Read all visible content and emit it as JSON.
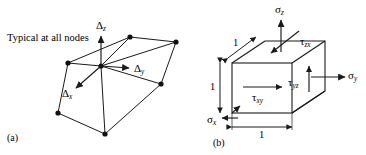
{
  "figure": {
    "panels": [
      {
        "id": "a",
        "caption": "(a)",
        "note": "Typical at all nodes",
        "labels": [
          {
            "name": "delta-z",
            "symbol": "Δ",
            "subscript": "z"
          },
          {
            "name": "delta-y",
            "symbol": "Δ",
            "subscript": "y"
          },
          {
            "name": "delta-x",
            "symbol": "Δ",
            "subscript": "x"
          }
        ],
        "nodes": [
          {
            "name": "node-center",
            "x": 101,
            "y": 66
          },
          {
            "name": "node-left-upper",
            "x": 68,
            "y": 63
          },
          {
            "name": "node-top-mid",
            "x": 130,
            "y": 37
          },
          {
            "name": "node-right-top",
            "x": 176,
            "y": 42
          },
          {
            "name": "node-right-mid",
            "x": 161,
            "y": 84
          },
          {
            "name": "node-bottom-mid",
            "x": 105,
            "y": 134
          },
          {
            "name": "node-left-lower",
            "x": 58,
            "y": 113
          }
        ],
        "edges": [
          [
            "node-left-upper",
            "node-top-mid"
          ],
          [
            "node-top-mid",
            "node-right-top"
          ],
          [
            "node-right-top",
            "node-right-mid"
          ],
          [
            "node-right-mid",
            "node-bottom-mid"
          ],
          [
            "node-bottom-mid",
            "node-left-lower"
          ],
          [
            "node-left-lower",
            "node-left-upper"
          ],
          [
            "node-left-upper",
            "node-center"
          ],
          [
            "node-center",
            "node-top-mid"
          ],
          [
            "node-center",
            "node-right-top"
          ],
          [
            "node-center",
            "node-bottom-mid"
          ],
          [
            "node-center",
            "node-right-mid"
          ]
        ],
        "vectors": [
          {
            "name": "delta-z-arrow",
            "from": [
              101,
              66
            ],
            "to": [
              101,
              34
            ]
          },
          {
            "name": "delta-y-arrow",
            "from": [
              101,
              66
            ],
            "to": [
              131,
              68
            ]
          },
          {
            "name": "delta-x-arrow",
            "from": [
              101,
              66
            ],
            "to": [
              74,
              90
            ]
          }
        ]
      },
      {
        "id": "b",
        "caption": "(b)",
        "labels": [
          {
            "name": "sigma-z",
            "symbol": "σ",
            "subscript": "z"
          },
          {
            "name": "sigma-y",
            "symbol": "σ",
            "subscript": "y"
          },
          {
            "name": "sigma-x",
            "symbol": "σ",
            "subscript": "x"
          },
          {
            "name": "tau-zx",
            "symbol": "τ",
            "subscript": "zx"
          },
          {
            "name": "tau-yz",
            "symbol": "τ",
            "subscript": "yz"
          },
          {
            "name": "tau-xy",
            "symbol": "τ",
            "subscript": "xy"
          }
        ],
        "dimensions": [
          {
            "name": "dim-top-depth",
            "value": "1"
          },
          {
            "name": "dim-left-height",
            "value": "1"
          },
          {
            "name": "dim-bottom-width",
            "value": "1"
          }
        ],
        "cube": {
          "front_face": {
            "left": 232,
            "top": 63,
            "right": 292,
            "bottom": 113
          },
          "depth_dx": 33,
          "depth_dy": -22
        }
      }
    ],
    "colors": {
      "stroke": "#1a1a1a",
      "background": "#ffffff",
      "node_fill": "#111111"
    }
  }
}
